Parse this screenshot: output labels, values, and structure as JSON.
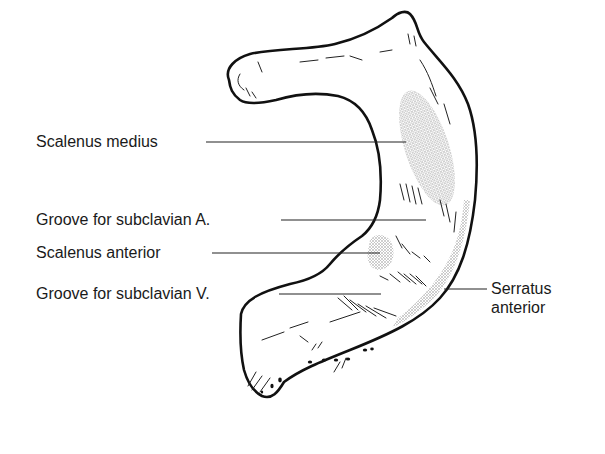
{
  "figure": {
    "background": "#ffffff",
    "ink": "#111111",
    "stipple": "#9a9a9a"
  },
  "labels": [
    {
      "id": "scalenus-medius",
      "text": "Scalenus medius"
    },
    {
      "id": "groove-subclavian-a",
      "text": "Groove for subclavian A."
    },
    {
      "id": "scalenus-anterior",
      "text": "Scalenus anterior"
    },
    {
      "id": "groove-subclavian-v",
      "text": "Groove for subclavian V."
    },
    {
      "id": "serratus-anterior",
      "text": "Serratus anterior",
      "lines": [
        "Serratus",
        "anterior"
      ]
    }
  ]
}
